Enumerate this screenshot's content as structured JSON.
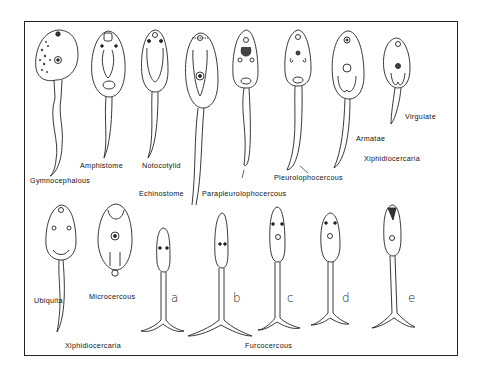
{
  "figure": {
    "top_row_labels": {
      "gymnocephalous": "Gymnocephalous",
      "amphistome": "Amphistome",
      "notocotylid": "Notocotylid",
      "echinostome": "Echinostome",
      "parapleurolophocercous": "Parapleurolophocercous",
      "pleurolophocercous": "Pleurolophocercous",
      "armatae": "Armatae",
      "virgulate": "Virgulate",
      "xiphidiocercaria_top": "Xiphidiocercaria"
    },
    "bottom_row_labels": {
      "ubiquita": "Ubiquita",
      "microcercous": "Microcercous",
      "xiphidiocercaria_bottom": "Xiphidiocercaria",
      "furcocercous": "Furcocercous"
    },
    "furcocercous_variants": [
      "a",
      "b",
      "c",
      "d",
      "e"
    ]
  }
}
